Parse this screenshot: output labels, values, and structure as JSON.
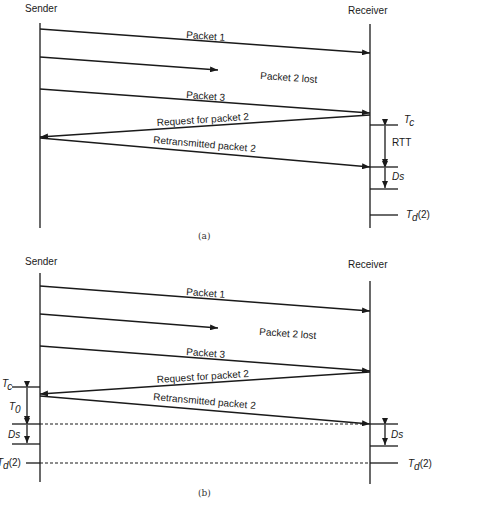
{
  "panel_a": {
    "caption": "(a)",
    "sender_label": "Sender",
    "receiver_label": "Receiver",
    "messages": [
      {
        "label": "Packet 1"
      },
      {
        "label": "Packet 2 lost"
      },
      {
        "label": "Packet 3"
      },
      {
        "label": "Request for packet 2"
      },
      {
        "label": "Retransmitted packet 2"
      }
    ],
    "markers": {
      "tc": "T",
      "tc_sub": "c",
      "rtt": "RTT",
      "ds": "Ds",
      "td": "T",
      "td_sub": "d",
      "td_arg": "(2)"
    }
  },
  "panel_b": {
    "caption": "(b)",
    "sender_label": "Sender",
    "receiver_label": "Receiver",
    "messages": [
      {
        "label": "Packet 1"
      },
      {
        "label": "Packet 2 lost"
      },
      {
        "label": "Packet 3"
      },
      {
        "label": "Request for packet 2"
      },
      {
        "label": "Retransmitted packet 2"
      }
    ],
    "markers": {
      "tc": "T",
      "tc_sub": "c",
      "t0": "T",
      "t0_sub": "0",
      "ds_left": "Ds",
      "ds_right": "Ds",
      "td_left": "T",
      "td_left_sub": "d",
      "td_left_arg": "(2)",
      "td_right": "T",
      "td_right_sub": "d",
      "td_right_arg": "(2)"
    }
  }
}
